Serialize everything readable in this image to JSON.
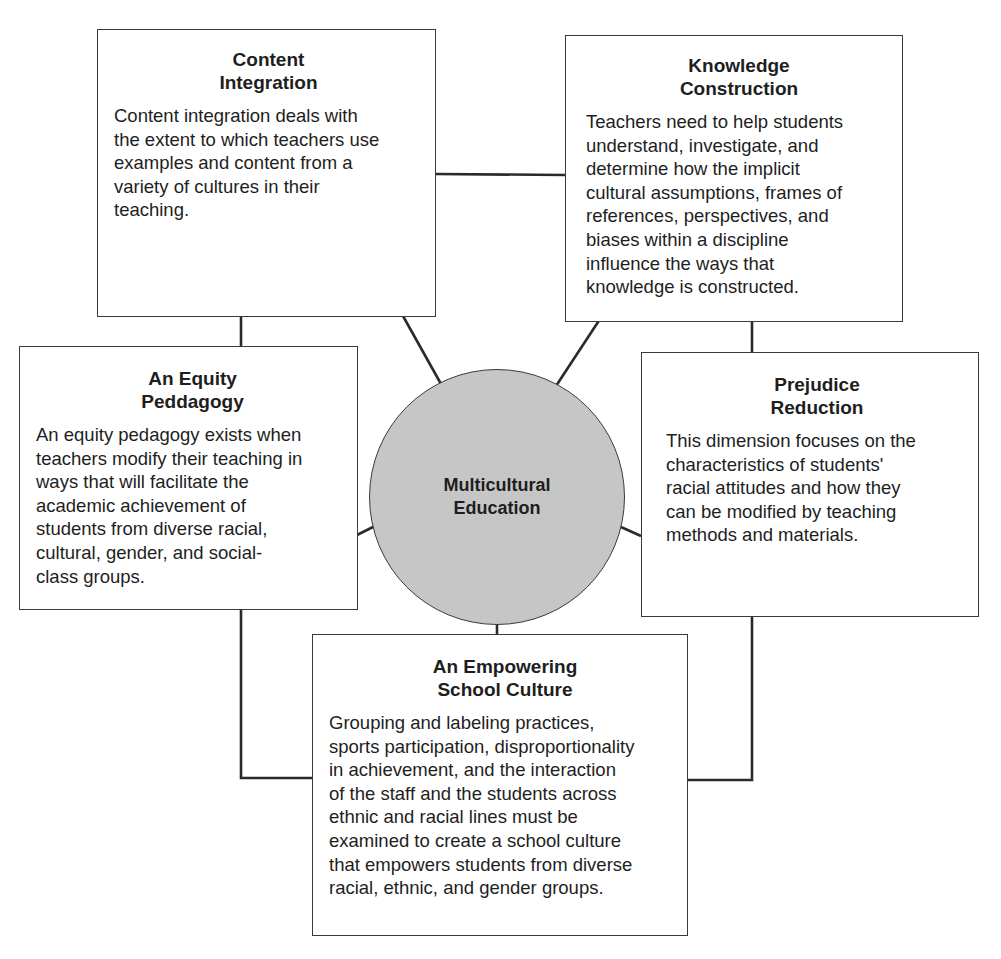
{
  "diagram": {
    "center": {
      "label_lines": [
        "Multicultural",
        "Education"
      ],
      "fill": "#c6c6c6"
    },
    "dimensions": [
      {
        "id": "content-integration",
        "title_lines": [
          "Content",
          "Integration"
        ],
        "body_lines": [
          "Content integration deals with",
          "the extent to which teachers use",
          "examples and content from a",
          "variety of cultures in their",
          "teaching."
        ]
      },
      {
        "id": "knowledge-construction",
        "title_lines": [
          "Knowledge",
          "Construction"
        ],
        "body_lines": [
          "Teachers need to help students",
          "understand, investigate, and",
          "determine how the implicit",
          "cultural assumptions, frames of",
          "references, perspectives, and",
          "biases within a discipline",
          "influence the ways that",
          "knowledge is constructed."
        ]
      },
      {
        "id": "equity-pedagogy",
        "title_lines": [
          "An Equity",
          "Peddagogy"
        ],
        "body_lines": [
          "An equity pedagogy exists when",
          "teachers modify their teaching in",
          "ways that will facilitate the",
          "academic achievement of",
          "students from diverse racial,",
          "cultural, gender, and social-",
          "class groups."
        ]
      },
      {
        "id": "prejudice-reduction",
        "title_lines": [
          "Prejudice",
          "Reduction"
        ],
        "body_lines": [
          "This dimension focuses on the",
          "characteristics of students'",
          "racial attitudes and how they",
          "can be modified by teaching",
          "methods and materials."
        ]
      },
      {
        "id": "empowering-school-culture",
        "title_lines": [
          "An Empowering",
          "School Culture"
        ],
        "body_lines": [
          "Grouping and labeling practices,",
          "sports participation, disproportionality",
          "in achievement, and the interaction",
          "of the staff and the students across",
          "ethnic and racial lines must be",
          "examined to create a school culture",
          "that empowers students from diverse",
          "racial, ethnic, and gender groups."
        ]
      }
    ],
    "line_color": "#2a2a2a",
    "border_color": "#3a3a3a"
  }
}
